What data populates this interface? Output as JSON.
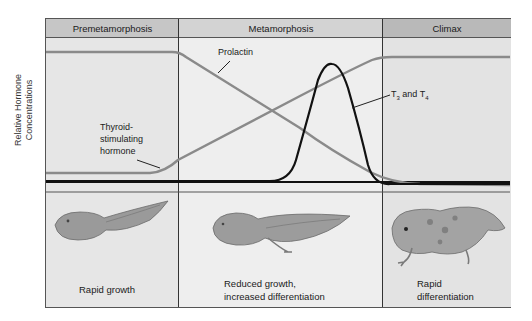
{
  "diagram": {
    "y_axis_label_line1": "Relative Hormone",
    "y_axis_label_line2": "Concentrations",
    "phases": [
      {
        "label": "Premetamorphosis",
        "caption_line1": "Rapid growth",
        "caption_line2": "",
        "illustration": "tadpole-early"
      },
      {
        "label": "Metamorphosis",
        "caption_line1": "Reduced growth,",
        "caption_line2": "increased differentiation",
        "illustration": "tadpole-with-hindlimbs"
      },
      {
        "label": "Climax",
        "caption_line1": "Rapid",
        "caption_line2": "differentiation",
        "illustration": "froglet"
      }
    ],
    "curves": [
      {
        "name": "Prolactin",
        "label": "Prolactin",
        "color": "#8a8a8a",
        "trend": "high plateau, declines during metamorphosis, low at climax"
      },
      {
        "name": "TSH",
        "label_line1": "Thyroid-",
        "label_line2": "stimulating",
        "label_line3": "hormone",
        "color": "#8a8a8a",
        "trend": "low plateau, rises during metamorphosis, high at climax"
      },
      {
        "name": "T3 and T4",
        "label": "T3 and T4",
        "color": "#111111",
        "trend": "baseline low, sharp peak late metamorphosis, low at climax"
      }
    ],
    "colors": {
      "header_bg": "#c4c4c4",
      "panel_bg": "#eaeaea",
      "climax_bg": "#e0e0e0",
      "grey_curve": "#8a8a8a",
      "black_curve": "#111111"
    }
  }
}
